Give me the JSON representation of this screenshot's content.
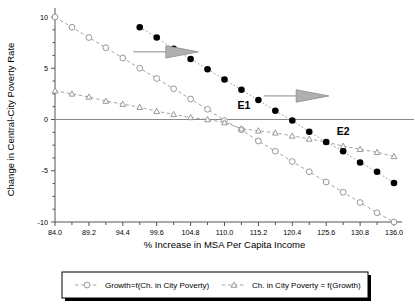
{
  "chart_data": {
    "type": "line",
    "title": "",
    "xlabel": "% Increase in MSA Per Capita Income",
    "ylabel": "Change in Central-City Poverty Rate",
    "xlim": [
      84.0,
      136.0
    ],
    "ylim": [
      -10,
      10
    ],
    "xticks": [
      "84.0",
      "89.2",
      "94.4",
      "99.6",
      "104.8",
      "110.0",
      "115.2",
      "120.4",
      "125.6",
      "130.8",
      "136.0"
    ],
    "xtick_values": [
      84.0,
      89.2,
      94.4,
      99.6,
      104.8,
      110.0,
      115.2,
      120.4,
      125.6,
      130.8,
      136.0
    ],
    "yticks": [
      "10",
      "5",
      "0",
      "-5",
      "-10"
    ],
    "ytick_values": [
      10,
      5,
      0,
      -5,
      -10
    ],
    "minor_ticks": true,
    "grid": false,
    "legend_position": "below-outside",
    "series": [
      {
        "name": "Growth=f(Ch. in City Poverty)",
        "marker": "open-circle",
        "linestyle": "dashed",
        "color": "#8d8d8d",
        "x": [
          84.0,
          86.6,
          89.2,
          91.8,
          94.4,
          97.0,
          99.6,
          102.2,
          104.8,
          107.4,
          110.0,
          112.6,
          115.2,
          117.8,
          120.4,
          123.0,
          125.6,
          128.2,
          130.8,
          133.4,
          136.0
        ],
        "values": [
          10.0,
          9.0,
          8.0,
          7.0,
          6.0,
          5.0,
          4.0,
          3.0,
          2.0,
          1.0,
          -0.1,
          -1.0,
          -2.1,
          -3.1,
          -4.1,
          -5.1,
          -6.1,
          -7.1,
          -8.1,
          -9.1,
          -10.0
        ]
      },
      {
        "name": "Ch. in City Poverty = f(Growth)",
        "marker": "open-triangle",
        "linestyle": "dashed",
        "color": "#8d8d8d",
        "x": [
          84.0,
          86.6,
          89.2,
          91.8,
          94.4,
          97.0,
          99.6,
          102.2,
          104.8,
          107.4,
          110.0,
          112.6,
          115.2,
          117.8,
          120.4,
          123.0,
          125.6,
          128.2,
          130.8,
          133.4,
          136.0
        ],
        "values": [
          2.8,
          2.5,
          2.2,
          1.8,
          1.5,
          1.2,
          0.8,
          0.5,
          0.2,
          0.0,
          -0.3,
          -0.9,
          -1.1,
          -1.3,
          -1.6,
          -1.9,
          -2.2,
          -2.6,
          -2.9,
          -3.2,
          -3.6
        ]
      },
      {
        "name": "Equilibrium-shift path",
        "marker": "filled-circle",
        "linestyle": "dotted",
        "color": "#000000",
        "x": [
          97.0,
          99.6,
          102.2,
          104.8,
          107.4,
          110.0,
          112.6,
          115.2,
          117.8,
          120.4,
          123.0,
          125.6,
          128.2,
          130.8,
          133.4,
          136.0
        ],
        "values": [
          9.0,
          8.0,
          6.9,
          5.9,
          4.9,
          3.9,
          2.9,
          1.9,
          0.85,
          -0.1,
          -1.2,
          -2.2,
          -3.1,
          -4.2,
          -5.1,
          -6.2
        ]
      }
    ],
    "annotations": [
      {
        "label": "E1",
        "x": 112.0,
        "y": 1.0
      },
      {
        "label": "E2",
        "x": 127.2,
        "y": -1.5
      }
    ],
    "arrows": [
      {
        "x_start": 96.0,
        "x_end": 106.0,
        "y": 6.6
      },
      {
        "x_start": 116.0,
        "x_end": 126.0,
        "y": 2.3
      },
      {
        "x_start": 148.0,
        "x_end": 158.0,
        "y": -6.7
      }
    ]
  },
  "legend": {
    "items": [
      {
        "label": "Growth=f(Ch. in City Poverty)",
        "marker": "open-circle"
      },
      {
        "label": "Ch. in City Poverty = f(Growth)",
        "marker": "open-triangle"
      }
    ]
  }
}
